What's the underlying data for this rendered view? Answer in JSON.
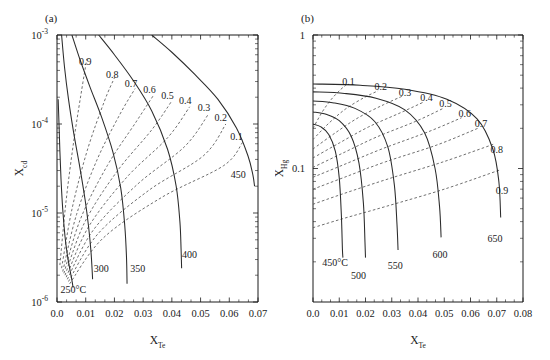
{
  "figure": {
    "background": "#ffffff",
    "line_color": "#2b2b2b",
    "dash_color": "#555555"
  },
  "panels": [
    {
      "tag": "(a)",
      "xaxis": {
        "label_base": "X",
        "label_sub": "Te",
        "scale": "linear",
        "min": 0.0,
        "max": 0.07,
        "ticks": [
          "0.0",
          "0.01",
          "0.02",
          "0.03",
          "0.04",
          "0.05",
          "0.06",
          "0.07"
        ],
        "tick_values": [
          0.0,
          0.01,
          0.02,
          0.03,
          0.04,
          0.05,
          0.06,
          0.07
        ],
        "minor_per_major": 2
      },
      "yaxis": {
        "label_base": "X",
        "label_sub": "cd",
        "scale": "log",
        "min": 1e-06,
        "max": 0.001,
        "ticks": [
          "10",
          "10",
          "10",
          "10"
        ],
        "tick_exponents": [
          "-3",
          "-4",
          "-5",
          "-6"
        ],
        "tick_values": [
          0.001,
          0.0001,
          1e-05,
          1e-06
        ]
      },
      "isotherms": [
        {
          "label": "250°C",
          "label_x": 0.0012,
          "label_y": 1.25e-06,
          "anchor": "start"
        },
        {
          "label": "300",
          "label_x": 0.0128,
          "label_y": 2.2e-06,
          "anchor": "start"
        },
        {
          "label": "350",
          "label_x": 0.0255,
          "label_y": 2.2e-06,
          "anchor": "start"
        },
        {
          "label": "400",
          "label_x": 0.0435,
          "label_y": 3.1e-06,
          "anchor": "start"
        },
        {
          "label": "450",
          "label_x": 0.0605,
          "label_y": 2.45e-05,
          "anchor": "start"
        }
      ],
      "contours": [
        {
          "label": "0.9",
          "label_x": 0.0098,
          "label_y": 0.000465
        },
        {
          "label": "0.8",
          "label_x": 0.0192,
          "label_y": 0.00033
        },
        {
          "label": "0.7",
          "label_x": 0.0258,
          "label_y": 0.000262
        },
        {
          "label": "0.6",
          "label_x": 0.0322,
          "label_y": 0.000222
        },
        {
          "label": "0.5",
          "label_x": 0.0385,
          "label_y": 0.000192
        },
        {
          "label": "0.4",
          "label_x": 0.0447,
          "label_y": 0.000166
        },
        {
          "label": "0.3",
          "label_x": 0.0512,
          "label_y": 0.00014
        },
        {
          "label": "0.2",
          "label_x": 0.057,
          "label_y": 0.000107
        },
        {
          "label": "0.1",
          "label_x": 0.0625,
          "label_y": 6.6e-05
        }
      ],
      "chart_note": "Cd partial-pressure / composition isotherms vs Te mole fraction"
    },
    {
      "tag": "(b)",
      "xaxis": {
        "label_base": "X",
        "label_sub": "Te",
        "scale": "linear",
        "min": 0.0,
        "max": 0.08,
        "ticks": [
          "0.0",
          "0.01",
          "0.02",
          "0.03",
          "0.04",
          "0.05",
          "0.06",
          "0.07",
          "0.08"
        ],
        "tick_values": [
          0.0,
          0.01,
          0.02,
          0.03,
          0.04,
          0.05,
          0.06,
          0.07,
          0.08
        ],
        "minor_per_major": 2
      },
      "yaxis": {
        "label_base": "X",
        "label_sub": "Hg",
        "scale": "log",
        "min": 0.01,
        "max": 1.0,
        "ticks": [
          "1",
          "0.1"
        ],
        "tick_values": [
          1.0,
          0.1
        ]
      },
      "isotherms": [
        {
          "label": "450°C",
          "label_x": 0.0035,
          "label_y": 0.0185,
          "anchor": "start"
        },
        {
          "label": "500",
          "label_x": 0.0145,
          "label_y": 0.0148,
          "anchor": "start"
        },
        {
          "label": "550",
          "label_x": 0.0285,
          "label_y": 0.0178,
          "anchor": "start"
        },
        {
          "label": "600",
          "label_x": 0.0455,
          "label_y": 0.0215,
          "anchor": "start"
        },
        {
          "label": "650",
          "label_x": 0.0665,
          "label_y": 0.028,
          "anchor": "start"
        }
      ],
      "contours": [
        {
          "label": "0.1",
          "label_x": 0.0135,
          "label_y": 0.425
        },
        {
          "label": "0.2",
          "label_x": 0.0258,
          "label_y": 0.385
        },
        {
          "label": "0.3",
          "label_x": 0.035,
          "label_y": 0.352
        },
        {
          "label": "0.4",
          "label_x": 0.0432,
          "label_y": 0.32
        },
        {
          "label": "0.5",
          "label_x": 0.0505,
          "label_y": 0.29
        },
        {
          "label": "0.6",
          "label_x": 0.0578,
          "label_y": 0.245
        },
        {
          "label": "0.7",
          "label_x": 0.064,
          "label_y": 0.205
        },
        {
          "label": "0.8",
          "label_x": 0.07,
          "label_y": 0.13
        },
        {
          "label": "0.9",
          "label_x": 0.072,
          "label_y": 0.064
        }
      ],
      "chart_note": "Hg mole fraction isotherms vs Te mole fraction"
    }
  ],
  "chart_data": {
    "type": "line",
    "title": "",
    "subplots": [
      {
        "tag": "(a)",
        "xlabel": "X_Te",
        "ylabel": "X_cd",
        "xscale": "linear",
        "yscale": "log",
        "xlim": [
          0.0,
          0.07
        ],
        "ylim": [
          1e-06,
          0.001
        ],
        "grid": false,
        "legend": "none",
        "series": [
          {
            "name": "250°C",
            "style": "solid",
            "x": [
              0.0004,
              0.0007,
              0.001,
              0.0014,
              0.002,
              0.0028,
              0.0036,
              0.0044,
              0.005,
              0.0054,
              0.0056
            ],
            "y": [
              0.00019,
              0.0001,
              5e-05,
              2.4e-05,
              1.1e-05,
              5.4e-06,
              3.4e-06,
              2.4e-06,
              1.9e-06,
              1.6e-06,
              1.45e-06
            ]
          },
          {
            "name": "300",
            "style": "solid",
            "x": [
              0.0016,
              0.0026,
              0.004,
              0.0058,
              0.008,
              0.0098,
              0.011,
              0.0118,
              0.0122,
              0.0124
            ],
            "y": [
              0.001,
              0.00044,
              0.00019,
              8e-05,
              3.2e-05,
              1.4e-05,
              7e-06,
              3.8e-06,
              2.4e-06,
              1.8e-06
            ]
          },
          {
            "name": "350",
            "style": "solid",
            "x": [
              0.0052,
              0.008,
              0.0115,
              0.0155,
              0.0195,
              0.0222,
              0.0236,
              0.0242,
              0.0244
            ],
            "y": [
              0.001,
              0.00053,
              0.00026,
              0.00012,
              4.8e-05,
              1.9e-05,
              7.2e-06,
              3.2e-06,
              1.6e-06
            ]
          },
          {
            "name": "400",
            "style": "solid",
            "x": [
              0.0145,
              0.02,
              0.0265,
              0.033,
              0.0385,
              0.0415,
              0.0428,
              0.0432,
              0.0434
            ],
            "y": [
              0.001,
              0.0006,
              0.00031,
              0.00014,
              5.2e-05,
              2e-05,
              8e-06,
              4e-06,
              2.4e-06
            ]
          },
          {
            "name": "450",
            "style": "solid",
            "x": [
              0.033,
              0.04,
              0.048,
              0.056,
              0.0625,
              0.0665,
              0.0682,
              0.0688
            ],
            "y": [
              0.001,
              0.00064,
              0.00036,
              0.00019,
              9e-05,
              4.4e-05,
              2.7e-05,
              2e-05
            ]
          }
        ],
        "contours": [
          {
            "name": "0.9",
            "style": "dashed",
            "x": [
              0.001,
              0.0032,
              0.006,
              0.009,
              0.0104
            ],
            "y": [
              2.6e-06,
              1.4e-05,
              7e-05,
              0.00029,
              0.00054
            ]
          },
          {
            "name": "0.8",
            "style": "dashed",
            "x": [
              0.0016,
              0.0052,
              0.0105,
              0.0165,
              0.02
            ],
            "y": [
              2.4e-06,
              1.1e-05,
              5e-05,
              0.00018,
              0.00033
            ]
          },
          {
            "name": "0.7",
            "style": "dashed",
            "x": [
              0.002,
              0.0068,
              0.014,
              0.022,
              0.0272
            ],
            "y": [
              2.2e-06,
              9.6e-06,
              4e-05,
              0.00013,
              0.00025
            ]
          },
          {
            "name": "0.6",
            "style": "dashed",
            "x": [
              0.0024,
              0.0082,
              0.0175,
              0.0275,
              0.0336
            ],
            "y": [
              2.1e-06,
              8.6e-06,
              3.4e-05,
              0.000105,
              0.00021
            ]
          },
          {
            "name": "0.5",
            "style": "dashed",
            "x": [
              0.0028,
              0.0096,
              0.0208,
              0.033,
              0.04
            ],
            "y": [
              2e-06,
              7.8e-06,
              2.9e-05,
              8.6e-05,
              0.000182
            ]
          },
          {
            "name": "0.4",
            "style": "dashed",
            "x": [
              0.0032,
              0.011,
              0.0242,
              0.0385,
              0.0462
            ],
            "y": [
              1.9e-06,
              7e-06,
              2.5e-05,
              7e-05,
              0.000156
            ]
          },
          {
            "name": "0.3",
            "style": "dashed",
            "x": [
              0.0036,
              0.0126,
              0.028,
              0.0445,
              0.0528
            ],
            "y": [
              1.8e-06,
              6.4e-06,
              2.1e-05,
              5.6e-05,
              0.00013
            ]
          },
          {
            "name": "0.2",
            "style": "dashed",
            "x": [
              0.004,
              0.0142,
              0.032,
              0.051,
              0.0588
            ],
            "y": [
              1.7e-06,
              5.8e-06,
              1.8e-05,
              4.4e-05,
              0.0001
            ]
          },
          {
            "name": "0.1",
            "style": "dashed",
            "x": [
              0.0044,
              0.016,
              0.0365,
              0.058,
              0.0646
            ],
            "y": [
              1.6e-06,
              5.2e-06,
              1.5e-05,
              3.4e-05,
              6.2e-05
            ]
          }
        ]
      },
      {
        "tag": "(b)",
        "xlabel": "X_Te",
        "ylabel": "X_Hg",
        "xscale": "linear",
        "yscale": "log",
        "xlim": [
          0.0,
          0.08
        ],
        "ylim": [
          0.01,
          1.0
        ],
        "grid": false,
        "legend": "none",
        "series": [
          {
            "name": "450°C",
            "style": "solid",
            "x": [
              0.0,
              0.003,
              0.006,
              0.0085,
              0.01,
              0.0108,
              0.0112,
              0.0114
            ],
            "y": [
              0.215,
              0.205,
              0.18,
              0.135,
              0.085,
              0.045,
              0.025,
              0.0215
            ]
          },
          {
            "name": "500",
            "style": "solid",
            "x": [
              0.0,
              0.005,
              0.01,
              0.0145,
              0.0175,
              0.0192,
              0.0198,
              0.02
            ],
            "y": [
              0.265,
              0.255,
              0.228,
              0.175,
              0.11,
              0.055,
              0.028,
              0.0215
            ]
          },
          {
            "name": "550",
            "style": "solid",
            "x": [
              0.0,
              0.008,
              0.016,
              0.0235,
              0.0285,
              0.031,
              0.032,
              0.0324
            ],
            "y": [
              0.32,
              0.31,
              0.282,
              0.225,
              0.145,
              0.075,
              0.038,
              0.0245
            ]
          },
          {
            "name": "600",
            "style": "solid",
            "x": [
              0.0,
              0.012,
              0.024,
              0.035,
              0.0425,
              0.0465,
              0.0482,
              0.0488
            ],
            "y": [
              0.375,
              0.365,
              0.336,
              0.275,
              0.185,
              0.1,
              0.052,
              0.0305
            ]
          },
          {
            "name": "650",
            "style": "solid",
            "x": [
              0.0,
              0.018,
              0.035,
              0.051,
              0.0625,
              0.0685,
              0.0708,
              0.0715
            ],
            "y": [
              0.43,
              0.42,
              0.392,
              0.33,
              0.235,
              0.14,
              0.08,
              0.043
            ]
          }
        ],
        "contours": [
          {
            "name": "0.1",
            "style": "dashed",
            "x": [
              0.0,
              0.0035,
              0.007,
              0.0105,
              0.0128
            ],
            "y": [
              0.2,
              0.265,
              0.33,
              0.39,
              0.425
            ]
          },
          {
            "name": "0.2",
            "style": "dashed",
            "x": [
              0.0,
              0.0062,
              0.0125,
              0.0195,
              0.0248
            ],
            "y": [
              0.165,
              0.22,
              0.28,
              0.34,
              0.382
            ]
          },
          {
            "name": "0.3",
            "style": "dashed",
            "x": [
              0.0,
              0.0085,
              0.0172,
              0.0268,
              0.034
            ],
            "y": [
              0.14,
              0.185,
              0.24,
              0.3,
              0.348
            ]
          },
          {
            "name": "0.4",
            "style": "dashed",
            "x": [
              0.0,
              0.0102,
              0.0212,
              0.0334,
              0.0422
            ],
            "y": [
              0.12,
              0.156,
              0.205,
              0.262,
              0.315
            ]
          },
          {
            "name": "0.5",
            "style": "dashed",
            "x": [
              0.0,
              0.0112,
              0.0242,
              0.039,
              0.0496
            ],
            "y": [
              0.102,
              0.13,
              0.172,
              0.225,
              0.282
            ]
          },
          {
            "name": "0.6",
            "style": "dashed",
            "x": [
              0.0,
              0.0118,
              0.0262,
              0.0438,
              0.0566
            ],
            "y": [
              0.086,
              0.107,
              0.14,
              0.188,
              0.24
            ]
          },
          {
            "name": "0.7",
            "style": "dashed",
            "x": [
              0.0,
              0.012,
              0.0275,
              0.0472,
              0.0628
            ],
            "y": [
              0.07,
              0.086,
              0.112,
              0.15,
              0.2
            ]
          },
          {
            "name": "0.8",
            "style": "dashed",
            "x": [
              0.0,
              0.0118,
              0.0282,
              0.0495,
              0.0688
            ],
            "y": [
              0.054,
              0.065,
              0.083,
              0.112,
              0.152
            ]
          },
          {
            "name": "0.9",
            "style": "dashed",
            "x": [
              0.0,
              0.0112,
              0.0278,
              0.05,
              0.0715
            ],
            "y": [
              0.036,
              0.042,
              0.052,
              0.07,
              0.098
            ]
          }
        ]
      }
    ]
  }
}
